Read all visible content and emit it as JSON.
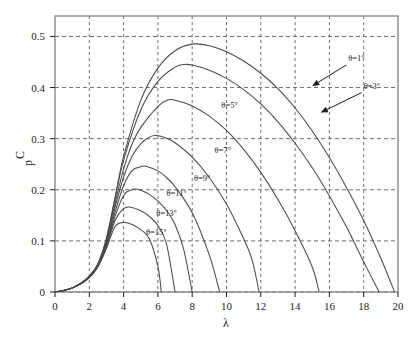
{
  "chart_data": {
    "type": "line",
    "title": "",
    "xlabel": "λ",
    "ylabel": "C",
    "ylabel_sub": "p",
    "xlim": [
      0,
      20
    ],
    "ylim": [
      0,
      0.54
    ],
    "grid": true,
    "legend": "inline-annotations",
    "xticks": [
      0,
      2,
      4,
      6,
      8,
      10,
      12,
      14,
      16,
      18,
      20
    ],
    "xtick_labels": [
      "0",
      "2",
      "4",
      "6",
      "8",
      "10",
      "12",
      "14",
      "16",
      "18",
      "20"
    ],
    "yticks": [
      0,
      0.1,
      0.2,
      0.3,
      0.4,
      0.5
    ],
    "ytick_labels": [
      "0",
      "0.1",
      "0.2",
      "0.3",
      "0.4",
      "0.5"
    ],
    "series": [
      {
        "name": "θ=1°",
        "label": "θ=1°",
        "peak_x": 8.0,
        "peak_y": 0.485,
        "zero_x": 19.8,
        "x": [
          0.0,
          0.5,
          1.0,
          1.5,
          2.0,
          2.5,
          3.0,
          3.5,
          4.0,
          5.0,
          6.0,
          7.0,
          8.0,
          9.0,
          10.0,
          11.0,
          12.0,
          13.0,
          14.0,
          15.0,
          16.0,
          17.0,
          18.0,
          19.0,
          19.8
        ],
        "y": [
          0.0,
          0.003,
          0.008,
          0.017,
          0.031,
          0.055,
          0.105,
          0.185,
          0.265,
          0.375,
          0.438,
          0.472,
          0.485,
          0.482,
          0.47,
          0.452,
          0.428,
          0.398,
          0.36,
          0.315,
          0.263,
          0.204,
          0.14,
          0.066,
          0.0
        ]
      },
      {
        "name": "θ=3°",
        "label": "θ=3°",
        "peak_x": 7.5,
        "peak_y": 0.445,
        "zero_x": 18.9,
        "x": [
          0.0,
          0.5,
          1.0,
          1.5,
          2.0,
          2.5,
          3.0,
          3.5,
          4.0,
          5.0,
          6.0,
          7.0,
          7.5,
          8.0,
          9.0,
          10.0,
          11.0,
          12.0,
          13.0,
          14.0,
          15.0,
          16.0,
          17.0,
          18.0,
          18.9
        ],
        "y": [
          0.0,
          0.003,
          0.008,
          0.017,
          0.031,
          0.055,
          0.104,
          0.182,
          0.258,
          0.356,
          0.412,
          0.44,
          0.445,
          0.444,
          0.434,
          0.418,
          0.396,
          0.368,
          0.333,
          0.291,
          0.243,
          0.188,
          0.127,
          0.059,
          0.0
        ]
      },
      {
        "name": "θ=5°",
        "label": "θ=5°",
        "peak_x": 6.6,
        "peak_y": 0.376,
        "zero_x": 15.4,
        "x": [
          0.0,
          0.5,
          1.0,
          1.5,
          2.0,
          2.5,
          3.0,
          3.5,
          4.0,
          4.5,
          5.0,
          6.0,
          6.6,
          7.0,
          8.0,
          9.0,
          10.0,
          11.0,
          12.0,
          13.0,
          14.0,
          15.0,
          15.4
        ],
        "y": [
          0.0,
          0.003,
          0.008,
          0.017,
          0.03,
          0.054,
          0.101,
          0.173,
          0.241,
          0.29,
          0.322,
          0.363,
          0.376,
          0.375,
          0.364,
          0.344,
          0.316,
          0.279,
          0.234,
          0.181,
          0.12,
          0.049,
          0.0
        ]
      },
      {
        "name": "θ=7°",
        "label": "θ=7°",
        "peak_x": 5.9,
        "peak_y": 0.306,
        "zero_x": 11.9,
        "x": [
          0.0,
          0.5,
          1.0,
          1.5,
          2.0,
          2.5,
          3.0,
          3.5,
          4.0,
          4.5,
          5.0,
          5.5,
          5.9,
          6.5,
          7.0,
          8.0,
          9.0,
          10.0,
          11.0,
          11.5,
          11.9
        ],
        "y": [
          0.0,
          0.003,
          0.008,
          0.017,
          0.03,
          0.053,
          0.098,
          0.165,
          0.225,
          0.266,
          0.29,
          0.303,
          0.306,
          0.301,
          0.292,
          0.264,
          0.224,
          0.172,
          0.104,
          0.062,
          0.0
        ]
      },
      {
        "name": "θ=9°",
        "label": "θ=9°",
        "peak_x": 5.3,
        "peak_y": 0.246,
        "zero_x": 9.6,
        "x": [
          0.0,
          0.5,
          1.0,
          1.5,
          2.0,
          2.5,
          3.0,
          3.5,
          4.0,
          4.5,
          5.0,
          5.3,
          6.0,
          6.5,
          7.0,
          8.0,
          9.0,
          9.6
        ],
        "y": [
          0.0,
          0.003,
          0.008,
          0.016,
          0.029,
          0.052,
          0.094,
          0.156,
          0.208,
          0.238,
          0.245,
          0.246,
          0.237,
          0.224,
          0.206,
          0.155,
          0.072,
          0.0
        ]
      },
      {
        "name": "θ=11°",
        "label": "θ=11°",
        "peak_x": 4.8,
        "peak_y": 0.201,
        "zero_x": 8.0,
        "x": [
          0.0,
          0.5,
          1.0,
          1.5,
          2.0,
          2.5,
          3.0,
          3.5,
          4.0,
          4.4,
          4.8,
          5.5,
          6.0,
          6.5,
          7.0,
          7.5,
          8.0
        ],
        "y": [
          0.0,
          0.003,
          0.008,
          0.016,
          0.029,
          0.051,
          0.091,
          0.148,
          0.189,
          0.199,
          0.201,
          0.191,
          0.178,
          0.16,
          0.132,
          0.084,
          0.0
        ]
      },
      {
        "name": "θ=13°",
        "label": "θ=13°",
        "peak_x": 4.4,
        "peak_y": 0.166,
        "zero_x": 7.0,
        "x": [
          0.0,
          0.5,
          1.0,
          1.5,
          2.0,
          2.5,
          3.0,
          3.5,
          4.0,
          4.4,
          5.0,
          5.5,
          6.0,
          6.5,
          7.0
        ],
        "y": [
          0.0,
          0.003,
          0.008,
          0.016,
          0.028,
          0.05,
          0.088,
          0.14,
          0.163,
          0.166,
          0.159,
          0.148,
          0.13,
          0.094,
          0.0
        ]
      },
      {
        "name": "θ=15°",
        "label": "θ=15°",
        "peak_x": 4.0,
        "peak_y": 0.136,
        "zero_x": 6.2,
        "x": [
          0.0,
          0.5,
          1.0,
          1.5,
          2.0,
          2.5,
          3.0,
          3.5,
          4.0,
          4.5,
          5.0,
          5.5,
          6.0,
          6.2
        ],
        "y": [
          0.0,
          0.003,
          0.008,
          0.016,
          0.028,
          0.049,
          0.085,
          0.128,
          0.136,
          0.132,
          0.122,
          0.104,
          0.05,
          0.0
        ]
      }
    ],
    "annotations": [
      {
        "text": "θ=1°",
        "x": 17.1,
        "y": 0.452,
        "arrow": true
      },
      {
        "text": "θ=3°",
        "x": 18.0,
        "y": 0.398,
        "arrow": true
      },
      {
        "text": "θ=5°",
        "x": 9.7,
        "y": 0.36,
        "arrow": false
      },
      {
        "text": "θ=7°",
        "x": 9.3,
        "y": 0.272,
        "arrow": false
      },
      {
        "text": "θ=9°",
        "x": 8.1,
        "y": 0.218,
        "arrow": false
      },
      {
        "text": "θ=11°",
        "x": 6.5,
        "y": 0.188,
        "arrow": false
      },
      {
        "text": "θ=13°",
        "x": 5.9,
        "y": 0.148,
        "arrow": false
      },
      {
        "text": "θ=15°",
        "x": 5.3,
        "y": 0.112,
        "arrow": false
      }
    ],
    "colors": {
      "curve": "#4a4a4a",
      "grid": "#6e6e6e",
      "frame": "#8a8a8a",
      "text": "#1c1c1c"
    }
  }
}
